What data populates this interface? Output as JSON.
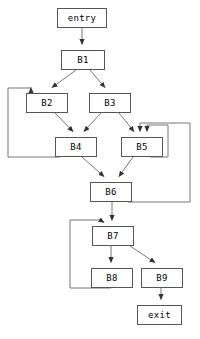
{
  "diagram": {
    "type": "directed-graph",
    "stroke_color": "#555555",
    "node_fill": "#ffffff",
    "text_color": "#000000",
    "canvas": {
      "width": 200,
      "height": 339
    },
    "nodes": [
      {
        "id": "entry",
        "label": "entry",
        "x": 57,
        "y": 8,
        "w": 50,
        "h": 20
      },
      {
        "id": "B1",
        "label": "B1",
        "x": 61,
        "y": 50,
        "w": 44,
        "h": 20
      },
      {
        "id": "B2",
        "label": "B2",
        "x": 26,
        "y": 93,
        "w": 42,
        "h": 20
      },
      {
        "id": "B3",
        "label": "B3",
        "x": 89,
        "y": 93,
        "w": 42,
        "h": 20
      },
      {
        "id": "B4",
        "label": "B4",
        "x": 55,
        "y": 137,
        "w": 42,
        "h": 20
      },
      {
        "id": "B5",
        "label": "B5",
        "x": 121,
        "y": 137,
        "w": 42,
        "h": 20
      },
      {
        "id": "B6",
        "label": "B6",
        "x": 90,
        "y": 182,
        "w": 42,
        "h": 20
      },
      {
        "id": "B7",
        "label": "B7",
        "x": 92,
        "y": 226,
        "w": 42,
        "h": 20
      },
      {
        "id": "B8",
        "label": "B8",
        "x": 91,
        "y": 268,
        "w": 42,
        "h": 20
      },
      {
        "id": "B9",
        "label": "B9",
        "x": 141,
        "y": 268,
        "w": 42,
        "h": 20
      },
      {
        "id": "exit",
        "label": "exit",
        "x": 137,
        "y": 305,
        "w": 45,
        "h": 20
      }
    ],
    "edges": [
      {
        "from": "entry",
        "to": "B1",
        "kind": "forward"
      },
      {
        "from": "B1",
        "to": "B2",
        "kind": "forward"
      },
      {
        "from": "B1",
        "to": "B3",
        "kind": "forward"
      },
      {
        "from": "B2",
        "to": "B4",
        "kind": "forward"
      },
      {
        "from": "B3",
        "to": "B4",
        "kind": "forward"
      },
      {
        "from": "B3",
        "to": "B5",
        "kind": "forward"
      },
      {
        "from": "B4",
        "to": "B2",
        "kind": "back"
      },
      {
        "from": "B4",
        "to": "B6",
        "kind": "forward"
      },
      {
        "from": "B5",
        "to": "B5",
        "kind": "self-loop"
      },
      {
        "from": "B5",
        "to": "B6",
        "kind": "forward"
      },
      {
        "from": "B6",
        "to": "B5",
        "kind": "back"
      },
      {
        "from": "B6",
        "to": "B7",
        "kind": "forward"
      },
      {
        "from": "B7",
        "to": "B8",
        "kind": "forward"
      },
      {
        "from": "B7",
        "to": "B9",
        "kind": "forward"
      },
      {
        "from": "B8",
        "to": "B7",
        "kind": "back"
      },
      {
        "from": "B9",
        "to": "exit",
        "kind": "forward"
      }
    ]
  }
}
